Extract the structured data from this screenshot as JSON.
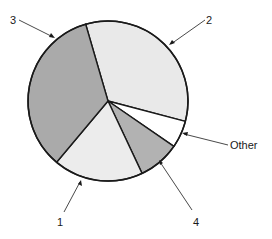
{
  "chart_data": {
    "type": "pie",
    "title": "",
    "categories": [
      "2",
      "Other",
      "4",
      "1",
      "3"
    ],
    "values": [
      33.6,
      5.5,
      8.4,
      18.1,
      34.4
    ],
    "unit": "percent (estimated from slice angles)",
    "start_angle_deg": 253.8,
    "direction": "clockwise",
    "legend": "none (leader-line labels)",
    "slices": [
      {
        "label": "2",
        "value": 33.6,
        "fill": "#e9e9e9"
      },
      {
        "label": "Other",
        "value": 5.5,
        "fill": "#ffffff"
      },
      {
        "label": "4",
        "value": 8.4,
        "fill": "#b2b2b2"
      },
      {
        "label": "1",
        "value": 18.1,
        "fill": "#ececec"
      },
      {
        "label": "3",
        "value": 34.4,
        "fill": "#aaaaaa"
      }
    ]
  },
  "labels": {
    "slice_2": "2",
    "slice_other": "Other",
    "slice_4": "4",
    "slice_1": "1",
    "slice_3": "3"
  },
  "colors": {
    "outline": "#1a1a1a",
    "background": "#ffffff"
  }
}
